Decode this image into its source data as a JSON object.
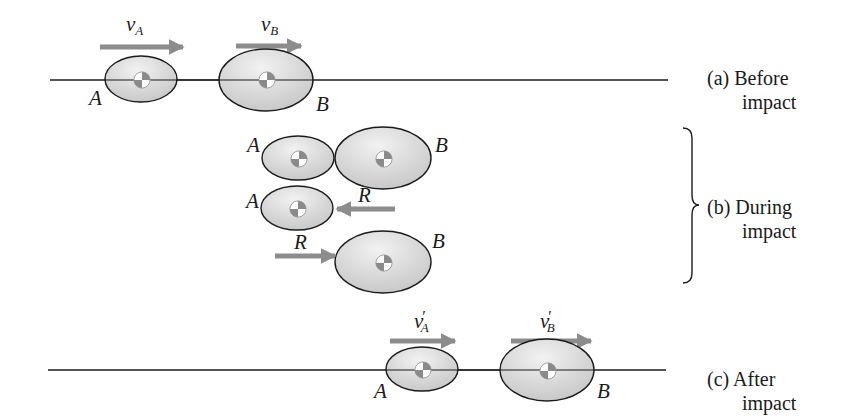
{
  "figure": {
    "colors": {
      "ellipse_fill": "#d4d4d4",
      "ellipse_highlight": "#f0f0f0",
      "ellipse_stroke": "#1a1a1a",
      "arrow": "#8c8c8c",
      "line": "#1a1a1a",
      "cm_dark": "#8a8a8a",
      "cm_light": "#ffffff"
    },
    "panels": [
      {
        "id": "a",
        "caption_line1": "(a) Before",
        "caption_line2": "impact",
        "labels": {
          "velocity_a": "v",
          "velocity_a_sub": "A",
          "velocity_b": "v",
          "velocity_b_sub": "B",
          "body_a": "A",
          "body_b": "B"
        }
      },
      {
        "id": "b",
        "caption_line1": "(b) During",
        "caption_line2": "impact",
        "labels": {
          "body_a_top": "A",
          "body_b_top": "B",
          "body_a_mid": "A",
          "force_on_a": "R",
          "force_on_b": "R",
          "body_b_bottom": "B"
        }
      },
      {
        "id": "c",
        "caption_line1": "(c) After",
        "caption_line2": "impact",
        "labels": {
          "velocity_a": "v",
          "velocity_a_sub": "A",
          "velocity_a_prime": "′",
          "velocity_b": "v",
          "velocity_b_sub": "B",
          "velocity_b_prime": "′",
          "body_a": "A",
          "body_b": "B"
        }
      }
    ]
  }
}
